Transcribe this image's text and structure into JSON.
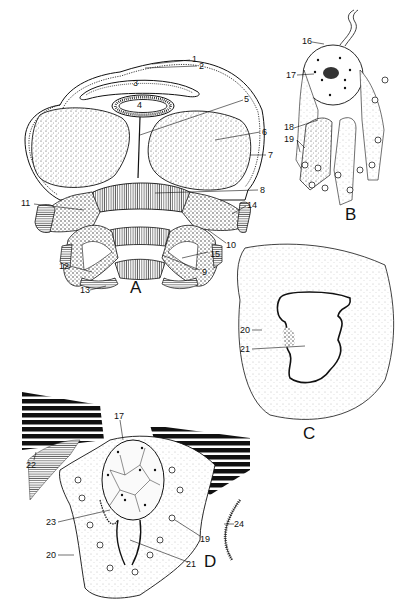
{
  "figure": {
    "panels": [
      {
        "id": "A",
        "letter": "A",
        "description": "transverse section with numbered structures"
      },
      {
        "id": "B",
        "letter": "B",
        "description": "cell with flagellum and surrounding tissue"
      },
      {
        "id": "C",
        "letter": "C",
        "description": "section with folded lumen"
      },
      {
        "id": "D",
        "letter": "D",
        "description": "section with muscle bundles and central cell"
      }
    ],
    "labels_A": [
      "1",
      "2",
      "3",
      "4",
      "5",
      "6",
      "7",
      "8",
      "9",
      "10",
      "11",
      "12",
      "13",
      "14",
      "15"
    ],
    "labels_B": [
      "16",
      "17",
      "18",
      "19"
    ],
    "labels_C": [
      "20",
      "21"
    ],
    "labels_D": [
      "17",
      "19",
      "20",
      "21",
      "22",
      "23",
      "24"
    ],
    "colors": {
      "ink": "#111111",
      "paper": "#ffffff",
      "stipple": "#555555"
    }
  }
}
